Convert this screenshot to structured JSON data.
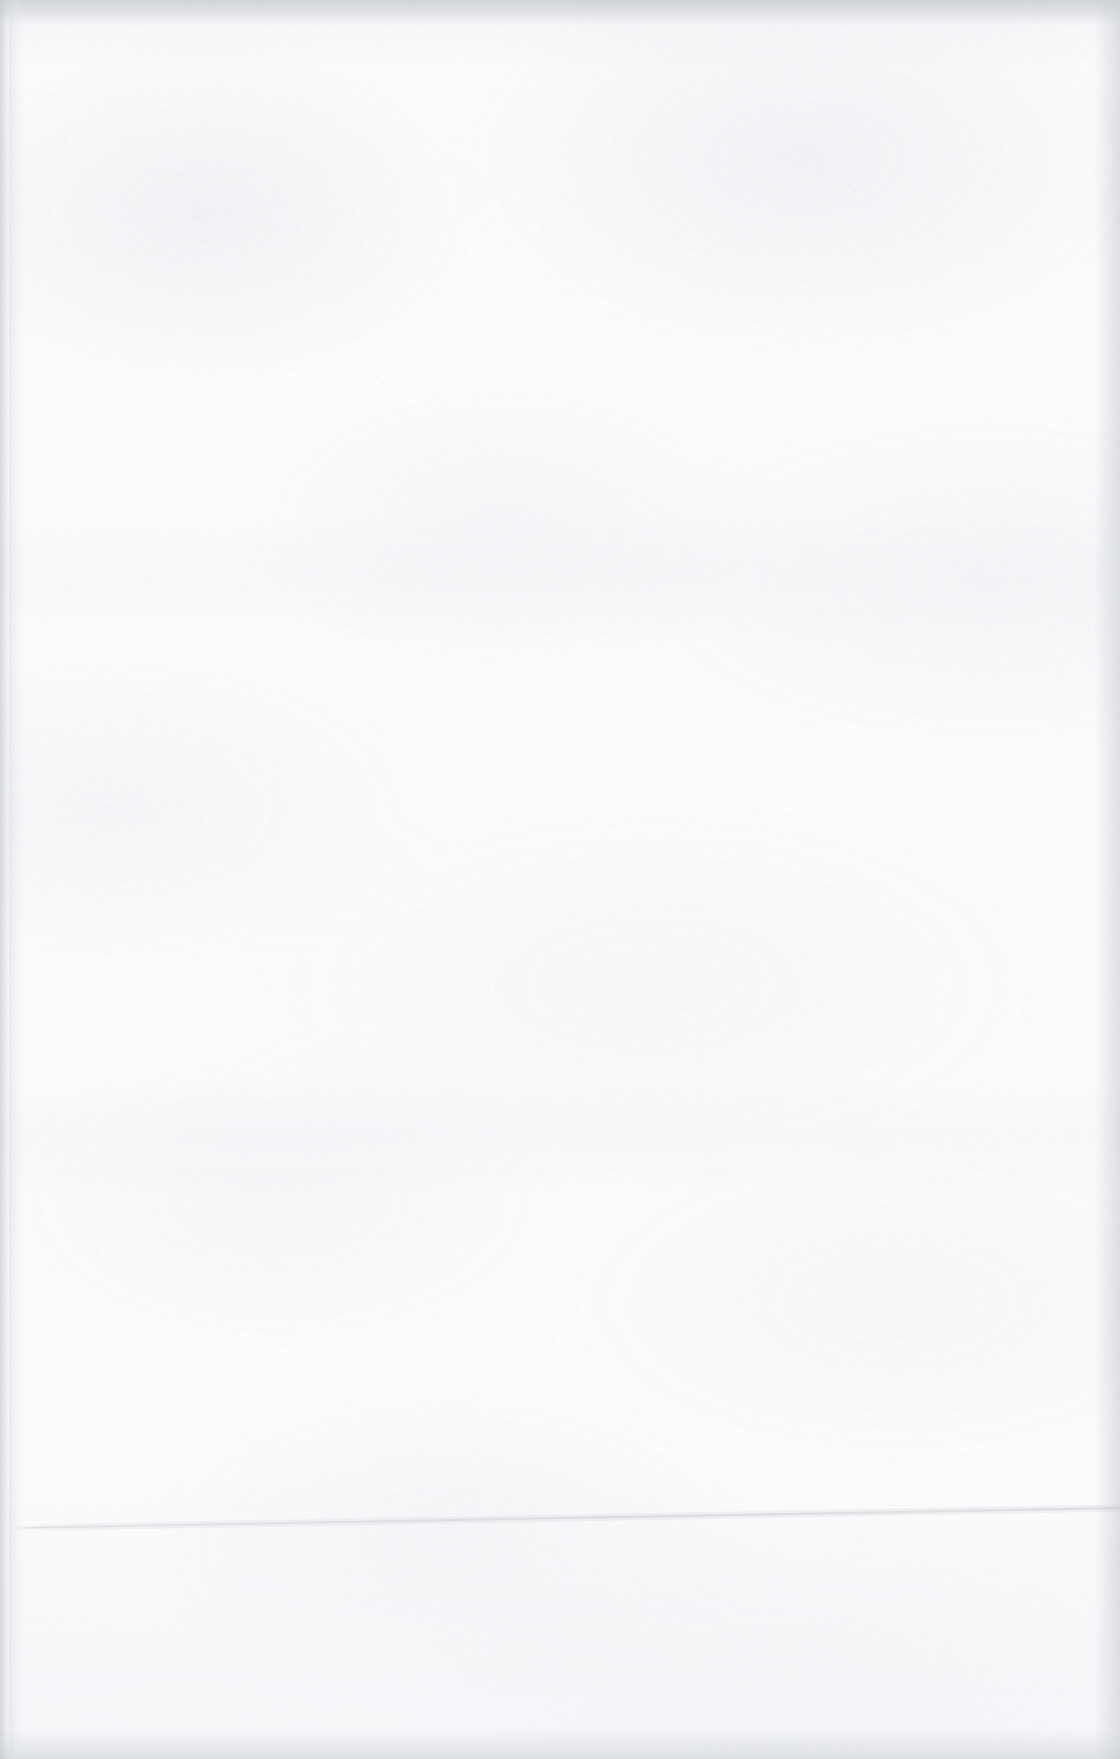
{
  "page": {
    "kind": "blank-scanned-paper",
    "width_px": 1120,
    "height_px": 1759,
    "visible_text": "",
    "orientation": "portrait"
  },
  "colors": {
    "paper_base": "#fcfcfd",
    "paper_mottle": "#e8eaee",
    "grain_speckle": "#c9ccd2",
    "edge_shadow": "#c4c7cd",
    "crease_line": "#c8cace",
    "lower_panel_tint": "#f0f2f5"
  },
  "features": {
    "crease": {
      "name": "faint-slanted-crease-line",
      "description": "single faint light-grey rule sloping gently upward from left to right",
      "x_start_px": 12,
      "y_start_px": 1528,
      "x_end_px": 1120,
      "y_end_px": 1508,
      "thickness_px": 2,
      "color": "#c8cace",
      "left_tip_fades": true
    },
    "edges": {
      "top_band_px": 26,
      "bottom_band_px": 30,
      "left_band_px": 10,
      "right_band_px": 26,
      "left_gutter_x_px": 9,
      "left_gutter_width_px": 16
    },
    "tonal_band_y_positions_px": [
      566,
      1132,
      1560
    ],
    "texture": "fine random speckle grain with broad soft mottling"
  }
}
